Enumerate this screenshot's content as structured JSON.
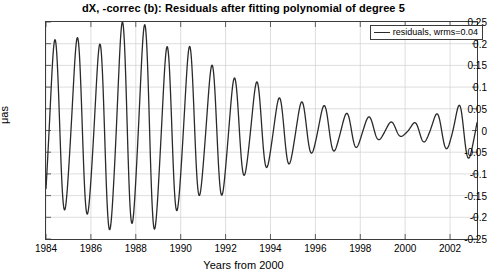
{
  "chart_data": {
    "type": "line",
    "title": "dX, -correc (b): Residuals after fitting polynomial of degree 5",
    "xlabel": "Years from 2000",
    "ylabel": "μas",
    "xlim": [
      1984,
      2003.2
    ],
    "ylim": [
      -0.25,
      0.25
    ],
    "grid": true,
    "legend_position": "top-right",
    "xticks": [
      1984,
      1986,
      1988,
      1990,
      1992,
      1994,
      1996,
      1998,
      2000,
      2002
    ],
    "xticklabels": [
      "1984",
      "1986",
      "1988",
      "1990",
      "1992",
      "1994",
      "1996",
      "1998",
      "2000",
      "2002"
    ],
    "yticks": [
      -0.25,
      -0.2,
      -0.15,
      -0.1,
      -0.05,
      0,
      0.05,
      0.1,
      0.15,
      0.2,
      0.25
    ],
    "yticklabels": [
      "-0.25",
      "-0.2",
      "-0.15",
      "-0.1",
      "-0.05",
      "0",
      "0.05",
      "0.1",
      "0.15",
      "0.2",
      "0.25"
    ],
    "series": [
      {
        "name": "residuals, wrms=0.04",
        "color": "#2a2a2a",
        "linewidth": 1.3,
        "description": "Annual-period oscillation whose envelope rises from about 0.19 at 1984 to a maximum near 0.23 around 1987.5, then decays steadily to nearly zero around 1999-2000, after which it grows again to about 0.07 by 2003.",
        "envelope_x": [
          1984.0,
          1985.0,
          1986.0,
          1987.5,
          1988.5,
          1990.0,
          1991.5,
          1993.0,
          1994.5,
          1996.0,
          1997.5,
          1999.0,
          2000.0,
          2001.0,
          2002.0,
          2002.6,
          2003.2
        ],
        "envelope_y": [
          0.21,
          0.19,
          0.195,
          0.232,
          0.225,
          0.18,
          0.145,
          0.105,
          0.075,
          0.055,
          0.04,
          0.022,
          0.012,
          0.028,
          0.045,
          0.062,
          0.055
        ],
        "period_years": 1.0,
        "phase_offset": -0.12,
        "mean_offset": 0.0,
        "samples_per_year": 80
      }
    ]
  },
  "legend": {
    "label": "residuals, wrms=0.04"
  }
}
